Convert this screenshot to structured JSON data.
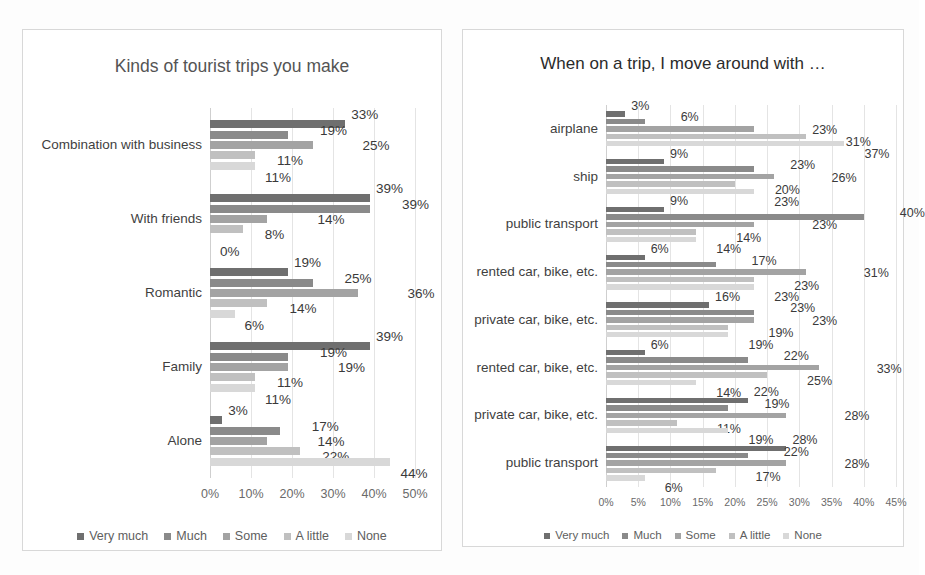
{
  "series_names": [
    "Very much",
    "Much",
    "Some",
    "A little",
    "None"
  ],
  "series_colors": [
    "#6f6f6f",
    "#8a8a8a",
    "#a3a3a3",
    "#c0c0c0",
    "#d8d8d8"
  ],
  "legend": {
    "items": [
      {
        "label": "Very much",
        "color": "#6f6f6f"
      },
      {
        "label": "Much",
        "color": "#8a8a8a"
      },
      {
        "label": "Some",
        "color": "#a3a3a3"
      },
      {
        "label": "A little",
        "color": "#c0c0c0"
      },
      {
        "label": "None",
        "color": "#d8d8d8"
      }
    ]
  },
  "chart_data": [
    {
      "id": "left",
      "type": "bar",
      "orientation": "horizontal",
      "title": "Kinds of tourist trips you make",
      "xlabel": "",
      "ylabel": "",
      "xlim": [
        0,
        50
      ],
      "xticks": [
        0,
        10,
        20,
        30,
        40,
        50
      ],
      "xticklabels": [
        "0%",
        "10%",
        "20%",
        "30%",
        "40%",
        "50%"
      ],
      "grid": true,
      "legend_position": "bottom",
      "categories": [
        "Combination with business",
        "With friends",
        "Romantic",
        "Family",
        "Alone"
      ],
      "series": [
        {
          "name": "Very much",
          "values": [
            33,
            39,
            19,
            39,
            3
          ]
        },
        {
          "name": "Much",
          "values": [
            19,
            39,
            25,
            19,
            17
          ]
        },
        {
          "name": "Some",
          "values": [
            25,
            14,
            36,
            19,
            14
          ]
        },
        {
          "name": "A little",
          "values": [
            11,
            8,
            14,
            11,
            22
          ]
        },
        {
          "name": "None",
          "values": [
            11,
            0,
            6,
            11,
            44
          ]
        }
      ],
      "data_labels": [
        [
          "33%",
          "19%",
          "25%",
          "11%",
          "11%"
        ],
        [
          "39%",
          "39%",
          "14%",
          "8%",
          "0%"
        ],
        [
          "19%",
          "25%",
          "36%",
          "14%",
          "6%"
        ],
        [
          "39%",
          "19%",
          "19%",
          "11%",
          "11%"
        ],
        [
          "3%",
          "17%",
          "14%",
          "22%",
          "44%"
        ]
      ]
    },
    {
      "id": "right",
      "type": "bar",
      "orientation": "horizontal",
      "title": "When on a trip, I move around with …",
      "xlabel": "",
      "ylabel": "",
      "xlim": [
        0,
        45
      ],
      "xticks": [
        0,
        5,
        10,
        15,
        20,
        25,
        30,
        35,
        40,
        45
      ],
      "xticklabels": [
        "0%",
        "5%",
        "10%",
        "15%",
        "20%",
        "25%",
        "30%",
        "35%",
        "40%",
        "45%"
      ],
      "grid": true,
      "legend_position": "bottom",
      "categories": [
        "airplane",
        "ship",
        "public transport",
        "rented car, bike, etc.",
        "private car, bike, etc.",
        "rented car, bike, etc.",
        "private car, bike, etc.",
        "public transport"
      ],
      "series": [
        {
          "name": "Very much",
          "values": [
            3,
            9,
            9,
            6,
            16,
            6,
            22,
            28
          ]
        },
        {
          "name": "Much",
          "values": [
            6,
            23,
            40,
            17,
            23,
            22,
            19,
            22
          ]
        },
        {
          "name": "Some",
          "values": [
            23,
            26,
            23,
            31,
            23,
            33,
            28,
            28
          ]
        },
        {
          "name": "A little",
          "values": [
            31,
            20,
            14,
            23,
            19,
            25,
            11,
            17
          ]
        },
        {
          "name": "None",
          "values": [
            37,
            23,
            14,
            23,
            19,
            14,
            19,
            6
          ]
        }
      ],
      "data_labels": [
        [
          "3%",
          "6%",
          "23%",
          "31%",
          "37%"
        ],
        [
          "9%",
          "23%",
          "26%",
          "20%",
          "23%"
        ],
        [
          "9%",
          "40%",
          "23%",
          "14%",
          "14%"
        ],
        [
          "6%",
          "17%",
          "31%",
          "23%",
          "23%"
        ],
        [
          "16%",
          "23%",
          "23%",
          "19%",
          "19%"
        ],
        [
          "6%",
          "22%",
          "33%",
          "25%",
          "14%"
        ],
        [
          "22%",
          "19%",
          "28%",
          "11%",
          "19%"
        ],
        [
          "28%",
          "22%",
          "28%",
          "17%",
          "6%"
        ]
      ]
    }
  ]
}
